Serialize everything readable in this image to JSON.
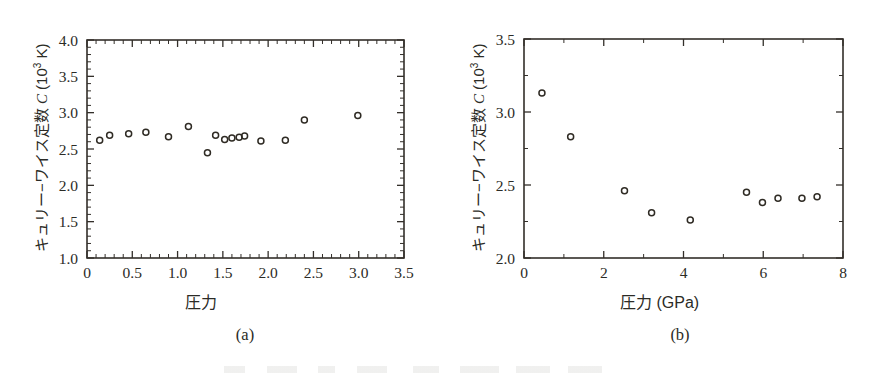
{
  "figure": {
    "background": "#ffffff",
    "ink_color": "#2b2b26",
    "panels": [
      {
        "id": "a",
        "caption": "(a)",
        "xlabel": "圧力",
        "ylabel_prefix": "キュリー−ワイス定数 ",
        "ylabel_symbol": "C",
        "ylabel_unit": " (10",
        "ylabel_exp": "3",
        "ylabel_unit_end": " K)"
      },
      {
        "id": "b",
        "caption": "(b)",
        "xlabel": "圧力 (GPa)",
        "ylabel_prefix": "キュリー−ワイス定数 ",
        "ylabel_symbol": "C",
        "ylabel_unit": " (10",
        "ylabel_exp": "3",
        "ylabel_unit_end": " K)"
      }
    ]
  },
  "chart_data": [
    {
      "type": "scatter",
      "panel": "a",
      "title": "",
      "xlabel": "圧力",
      "ylabel": "キュリー−ワイス定数 C (10³ K)",
      "xlim": [
        0,
        3.5
      ],
      "ylim": [
        1.0,
        4.0
      ],
      "xticks": [
        0,
        0.5,
        1.0,
        1.5,
        2.0,
        2.5,
        3.0,
        3.5
      ],
      "xticklabels": [
        "0",
        "0.5",
        "1.0",
        "1.5",
        "2.0",
        "2.5",
        "3.0",
        "3.5"
      ],
      "yticks": [
        1.0,
        1.5,
        2.0,
        2.5,
        3.0,
        3.5,
        4.0
      ],
      "yticklabels": [
        "1.0",
        "1.5",
        "2.0",
        "2.5",
        "3.0",
        "3.5",
        "4.0"
      ],
      "x_minor_interval": 0.1,
      "y_minor_interval": 0.1,
      "grid": false,
      "legend": null,
      "marker": "open-circle",
      "points": [
        {
          "x": 0.14,
          "y": 2.62
        },
        {
          "x": 0.25,
          "y": 2.69
        },
        {
          "x": 0.46,
          "y": 2.71
        },
        {
          "x": 0.65,
          "y": 2.73
        },
        {
          "x": 0.9,
          "y": 2.67
        },
        {
          "x": 1.12,
          "y": 2.81
        },
        {
          "x": 1.33,
          "y": 2.45
        },
        {
          "x": 1.42,
          "y": 2.69
        },
        {
          "x": 1.52,
          "y": 2.63
        },
        {
          "x": 1.6,
          "y": 2.65
        },
        {
          "x": 1.68,
          "y": 2.66
        },
        {
          "x": 1.74,
          "y": 2.68
        },
        {
          "x": 1.92,
          "y": 2.61
        },
        {
          "x": 2.19,
          "y": 2.62
        },
        {
          "x": 2.4,
          "y": 2.9
        },
        {
          "x": 2.99,
          "y": 2.96
        }
      ]
    },
    {
      "type": "scatter",
      "panel": "b",
      "title": "",
      "xlabel": "圧力 (GPa)",
      "ylabel": "キュリー−ワイス定数 C (10³ K)",
      "xlim": [
        0,
        8
      ],
      "ylim": [
        2.0,
        3.5
      ],
      "xticks": [
        0,
        2,
        4,
        6,
        8
      ],
      "xticklabels": [
        "0",
        "2",
        "4",
        "6",
        "8"
      ],
      "yticks": [
        2.0,
        2.5,
        3.0,
        3.5
      ],
      "yticklabels": [
        "2.0",
        "2.5",
        "3.0",
        "3.5"
      ],
      "x_minor_interval": 1,
      "y_minor_interval": 0.25,
      "grid": false,
      "legend": null,
      "marker": "open-circle",
      "points": [
        {
          "x": 0.45,
          "y": 3.13
        },
        {
          "x": 1.17,
          "y": 2.83
        },
        {
          "x": 2.52,
          "y": 2.46
        },
        {
          "x": 3.2,
          "y": 2.31
        },
        {
          "x": 4.17,
          "y": 2.26
        },
        {
          "x": 5.58,
          "y": 2.45
        },
        {
          "x": 5.98,
          "y": 2.38
        },
        {
          "x": 6.37,
          "y": 2.41
        },
        {
          "x": 6.97,
          "y": 2.41
        },
        {
          "x": 7.35,
          "y": 2.42
        }
      ]
    }
  ]
}
